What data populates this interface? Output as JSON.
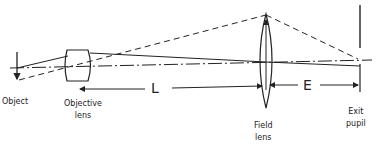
{
  "diagram": {
    "type": "optical-ray-diagram",
    "labels": {
      "object": "Object",
      "objective_line1": "Objective",
      "objective_line2": "lens",
      "field_line1": "Field",
      "field_line2": "lens",
      "exit_line1": "Exit",
      "exit_line2": "pupil",
      "distance_L": "L",
      "distance_E": "E"
    },
    "elements": [
      {
        "name": "Object",
        "x": 17
      },
      {
        "name": "Objective lens",
        "x": 78
      },
      {
        "name": "Field lens",
        "x": 266
      },
      {
        "name": "Exit pupil",
        "x": 360
      }
    ],
    "dimensions": [
      {
        "label": "L",
        "from": "Objective lens",
        "to": "Field lens"
      },
      {
        "label": "E",
        "from": "Field lens",
        "to": "Exit pupil"
      }
    ],
    "colors": {
      "line": "#222222",
      "background": "#ffffff"
    }
  }
}
